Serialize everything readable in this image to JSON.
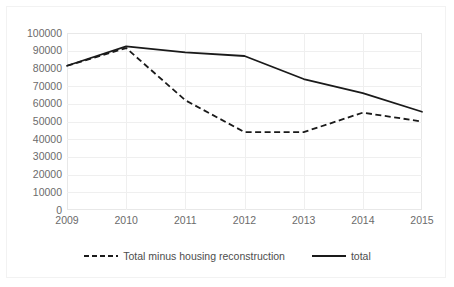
{
  "chart_data": {
    "type": "line",
    "title": "",
    "subtitle": "",
    "xlabel": "",
    "ylabel": "",
    "categories": [
      "2009",
      "2010",
      "2011",
      "2012",
      "2013",
      "2014",
      "2015"
    ],
    "series": [
      {
        "name": "Total minus housing reconstruction",
        "style": "dashed",
        "color": "#1a1a1a",
        "values": [
          81500,
          91500,
          62000,
          44000,
          44000,
          55000,
          50000
        ]
      },
      {
        "name": "total",
        "style": "solid",
        "color": "#1a1a1a",
        "values": [
          81500,
          92500,
          89000,
          87000,
          74000,
          66000,
          55500
        ]
      }
    ],
    "ylim": [
      0,
      100000
    ],
    "ytick_step": 10000,
    "yticks": [
      "100000",
      "90000",
      "80000",
      "70000",
      "60000",
      "50000",
      "40000",
      "30000",
      "20000",
      "10000",
      "0"
    ],
    "ytick_values": [
      100000,
      90000,
      80000,
      70000,
      60000,
      50000,
      40000,
      30000,
      20000,
      10000,
      0
    ],
    "grid": true,
    "grid_color": "#efefef",
    "legend_position": "bottom",
    "legend": [
      {
        "label": "Total minus housing reconstruction",
        "style": "dashed"
      },
      {
        "label": "total",
        "style": "solid"
      }
    ]
  }
}
